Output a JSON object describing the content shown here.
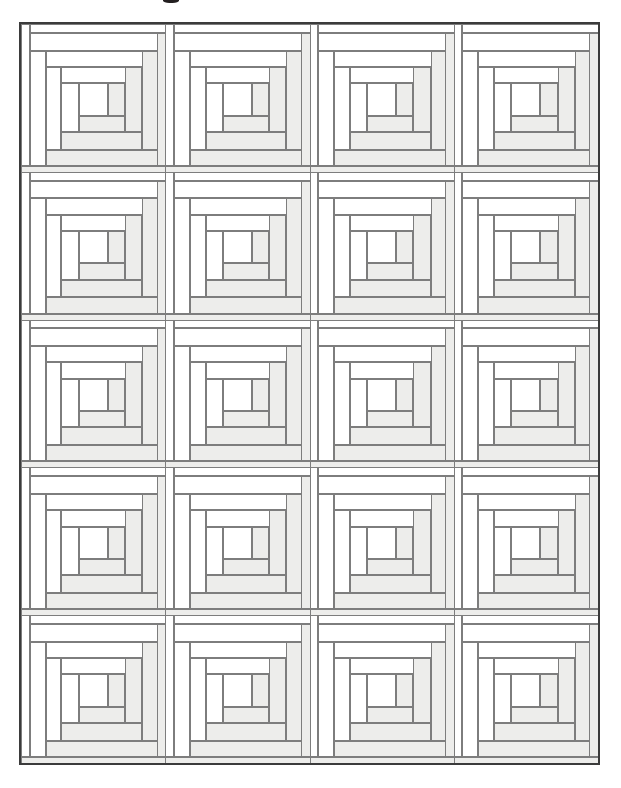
{
  "document": {
    "type": "quilt-pattern-diagram",
    "title_remnant_visible": true,
    "description": "Log Cabin quilt layout diagram, 4 blocks across by 5 blocks down"
  },
  "colors": {
    "page_background": "#ffffff",
    "light_fabric": "#ffffff",
    "dark_fabric": "#ededeb",
    "strip_outline": "#7d7d7d",
    "quilt_border": "#3b3b3b",
    "title_ink": "#231f20"
  },
  "quilt": {
    "name": "log-cabin-quilt",
    "columns": 4,
    "rows": 5,
    "block_count": 20,
    "bounds": {
      "x": 19,
      "y": 22,
      "width": 581,
      "height": 743
    },
    "block_size": {
      "width": 145.25,
      "height": 148.6
    }
  },
  "block": {
    "name": "log-cabin-block",
    "center_label": "center square",
    "rotation": "counter-clockwise spiral",
    "logs": [
      {
        "id": "log-01-center",
        "shade": "light",
        "x": 40.0,
        "y": 40.0,
        "w": 20.0,
        "h": 22.0
      },
      {
        "id": "log-02-right",
        "shade": "dark",
        "x": 60.0,
        "y": 40.0,
        "w": 12.0,
        "h": 22.0
      },
      {
        "id": "log-03-bottom",
        "shade": "dark",
        "x": 40.0,
        "y": 62.0,
        "w": 32.0,
        "h": 11.0
      },
      {
        "id": "log-04-left",
        "shade": "light",
        "x": 28.0,
        "y": 40.0,
        "w": 12.0,
        "h": 33.0
      },
      {
        "id": "log-05-top",
        "shade": "light",
        "x": 28.0,
        "y": 29.0,
        "w": 56.0,
        "h": 11.0
      },
      {
        "id": "log-06-right",
        "shade": "dark",
        "x": 72.0,
        "y": 29.0,
        "w": 12.0,
        "h": 44.0
      },
      {
        "id": "log-07-bottom",
        "shade": "dark",
        "x": 28.0,
        "y": 73.0,
        "w": 56.0,
        "h": 12.0
      },
      {
        "id": "log-08-left",
        "shade": "light",
        "x": 17.0,
        "y": 29.0,
        "w": 11.0,
        "h": 56.0
      },
      {
        "id": "log-09-top",
        "shade": "light",
        "x": 17.0,
        "y": 18.0,
        "w": 78.0,
        "h": 11.0
      },
      {
        "id": "log-10-right",
        "shade": "dark",
        "x": 84.0,
        "y": 18.0,
        "w": 11.0,
        "h": 67.0
      },
      {
        "id": "log-11-bottom",
        "shade": "dark",
        "x": 17.0,
        "y": 85.0,
        "w": 78.0,
        "h": 11.0
      },
      {
        "id": "log-12-left",
        "shade": "light",
        "x": 6.0,
        "y": 18.0,
        "w": 11.0,
        "h": 78.0
      },
      {
        "id": "log-13-top",
        "shade": "light",
        "x": 6.0,
        "y": 6.0,
        "w": 94.0,
        "h": 12.0
      },
      {
        "id": "log-14-right-outer",
        "shade": "dark",
        "x": 94.0,
        "y": 6.0,
        "w": 12.0,
        "h": 90.0
      },
      {
        "id": "log-15-bottom-outer",
        "shade": "dark",
        "x": 0.0,
        "y": 96.0,
        "w": 106.0,
        "h": 9.0
      },
      {
        "id": "log-16-left-outer",
        "shade": "light",
        "x": 0.0,
        "y": 0.0,
        "w": 6.0,
        "h": 96.0
      },
      {
        "id": "log-17-top-outer",
        "shade": "light",
        "x": 6.0,
        "y": 0.0,
        "w": 100.0,
        "h": 6.0
      }
    ]
  },
  "blocks": [
    {
      "row": 1,
      "col": 1,
      "name": "block-r1c1"
    },
    {
      "row": 1,
      "col": 2,
      "name": "block-r1c2"
    },
    {
      "row": 1,
      "col": 3,
      "name": "block-r1c3"
    },
    {
      "row": 1,
      "col": 4,
      "name": "block-r1c4"
    },
    {
      "row": 2,
      "col": 1,
      "name": "block-r2c1"
    },
    {
      "row": 2,
      "col": 2,
      "name": "block-r2c2"
    },
    {
      "row": 2,
      "col": 3,
      "name": "block-r2c3"
    },
    {
      "row": 2,
      "col": 4,
      "name": "block-r2c4"
    },
    {
      "row": 3,
      "col": 1,
      "name": "block-r3c1"
    },
    {
      "row": 3,
      "col": 2,
      "name": "block-r3c2"
    },
    {
      "row": 3,
      "col": 3,
      "name": "block-r3c3"
    },
    {
      "row": 3,
      "col": 4,
      "name": "block-r3c4"
    },
    {
      "row": 4,
      "col": 1,
      "name": "block-r4c1"
    },
    {
      "row": 4,
      "col": 2,
      "name": "block-r4c2"
    },
    {
      "row": 4,
      "col": 3,
      "name": "block-r4c3"
    },
    {
      "row": 4,
      "col": 4,
      "name": "block-r4c4"
    },
    {
      "row": 5,
      "col": 1,
      "name": "block-r5c1"
    },
    {
      "row": 5,
      "col": 2,
      "name": "block-r5c2"
    },
    {
      "row": 5,
      "col": 3,
      "name": "block-r5c3"
    },
    {
      "row": 5,
      "col": 4,
      "name": "block-r5c4"
    }
  ]
}
